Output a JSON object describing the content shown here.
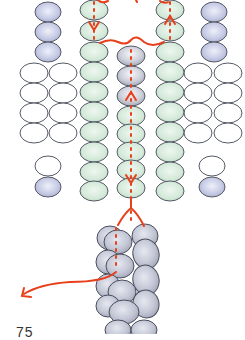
{
  "diagram": {
    "type": "beading-pattern",
    "step_number": "75",
    "colors": {
      "lavender_bead": "#c9cde6",
      "green_bead": "#d6eadb",
      "white_bead": "#ffffff",
      "grey_rope_bead": "#c4c8d6",
      "outline": "#555a66",
      "thread": "#e8401c"
    },
    "columns": [
      {
        "name": "outer-left",
        "beads": [
          "lavender",
          "lavender",
          "lavender",
          "white-pair",
          "white-pair",
          "white-pair",
          "white-pair",
          "white",
          "lavender"
        ]
      },
      {
        "name": "inner-left",
        "beads": [
          "green",
          "green",
          "green",
          "green",
          "green",
          "green",
          "green",
          "green",
          "green",
          "green"
        ]
      },
      {
        "name": "center",
        "beads": [
          "grey",
          "grey",
          "grey",
          "grey",
          "green",
          "green",
          "green",
          "green",
          "green",
          "green"
        ]
      },
      {
        "name": "inner-right",
        "beads": [
          "green",
          "green",
          "green",
          "green",
          "green",
          "green",
          "green",
          "green",
          "green",
          "green"
        ]
      },
      {
        "name": "outer-right",
        "beads": [
          "lavender",
          "lavender",
          "lavender",
          "white-pair",
          "white-pair",
          "white-pair",
          "white-pair",
          "white",
          "lavender"
        ]
      }
    ],
    "bottom": "spiral rope of grey beads",
    "thread_path": "red dotted line through center and inner columns with exit arrow to lower left"
  }
}
